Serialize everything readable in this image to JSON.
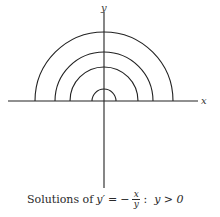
{
  "diagram": {
    "axes": {
      "x_label": "x",
      "y_label": "y"
    },
    "origin": [
      104,
      101
    ],
    "radii": [
      12,
      34,
      49,
      69
    ],
    "stroke_color": "#222222"
  },
  "caption": {
    "prefix": "Solutions of",
    "lhs": "y′",
    "equals": "=",
    "minus": "−",
    "numerator": "x",
    "denominator": "y",
    "colon": ":",
    "condition": "y > 0"
  }
}
